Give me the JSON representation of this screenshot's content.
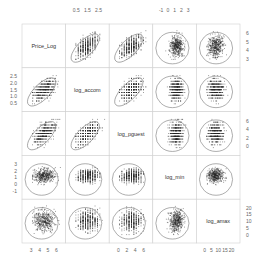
{
  "chart_data": {
    "type": "scatter",
    "subtype": "scatterplot-matrix",
    "title": "",
    "variables": [
      "Price_Log",
      "log_accom",
      "log_pguest",
      "log_min",
      "log_amax"
    ],
    "axis_ticks": {
      "Price_Log": {
        "labels": [
          "3",
          "4",
          "5",
          "6"
        ],
        "range": [
          2.8,
          6.8
        ]
      },
      "log_accom": {
        "labels": [
          "0.5",
          "1.0",
          "1.5",
          "2.0",
          "2.5"
        ],
        "range": [
          0.3,
          2.8
        ]
      },
      "log_pguest": {
        "labels": [
          "0",
          "2",
          "4",
          "6"
        ],
        "range": [
          -0.5,
          6.5
        ]
      },
      "log_min": {
        "labels": [
          "-1",
          "0",
          "1",
          "2",
          "3"
        ],
        "range": [
          -1.3,
          3.3
        ]
      },
      "log_amax": {
        "labels": [
          "0",
          "5",
          "10",
          "15",
          "20"
        ],
        "range": [
          -1,
          22
        ]
      }
    },
    "top_axis_labels": {
      "col2": [
        "0.5",
        "1.5",
        "2.5"
      ],
      "col4": [
        "-1",
        "0",
        "1",
        "2",
        "3"
      ]
    },
    "bottom_axis_labels": {
      "col1": [
        "3",
        "4",
        "5",
        "6"
      ],
      "col3": [
        "0",
        "2",
        "4",
        "6"
      ],
      "col5": [
        "0",
        "5",
        "10",
        "15",
        "20"
      ]
    },
    "left_axis_labels": {
      "row2": [
        "0.5",
        "1.0",
        "1.5",
        "2.0",
        "2.5"
      ],
      "row4": [
        "-1",
        "0",
        "1",
        "2",
        "3"
      ]
    },
    "right_axis_labels": {
      "row1": [
        "3",
        "4",
        "5",
        "6"
      ],
      "row3": [
        "0",
        "2",
        "4",
        "6"
      ],
      "row5": [
        "0",
        "5",
        "10",
        "15",
        "20"
      ]
    },
    "panel_features": "Each off-diagonal panel shows a dense scatter of points with a data ellipse overlay; log_accom and log_pguest are discrete (striped), Price_Log is continuous.",
    "grid": false,
    "legend": null
  }
}
